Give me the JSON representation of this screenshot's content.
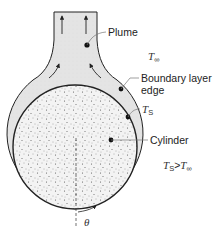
{
  "figure": {
    "type": "diagram"
  },
  "labels": {
    "plume": "Plume",
    "t_inf": {
      "base": "T",
      "sub": "∞"
    },
    "boundary_layer_edge_line1": "Boundary layer",
    "boundary_layer_edge_line2": "edge",
    "t_s": {
      "base": "T",
      "sub": "S"
    },
    "cylinder": "Cylinder",
    "condition": {
      "lhs_base": "T",
      "lhs_sub": "S",
      "op": ">",
      "rhs_base": "T",
      "rhs_sub": "∞"
    },
    "theta": "θ"
  },
  "colors": {
    "stroke": "#222222",
    "plume_fill": "#e6e6e6",
    "cylinder_fill": "#f2f2f2",
    "speckle": "#555555",
    "leader": "#777777"
  }
}
